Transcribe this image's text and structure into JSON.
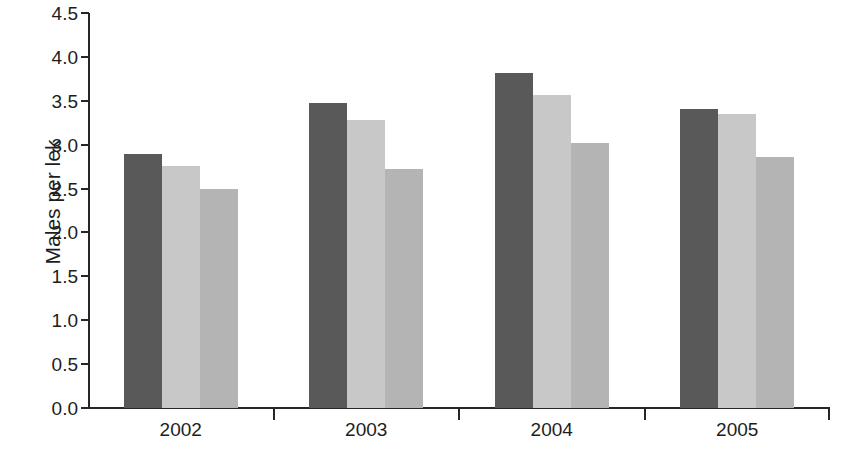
{
  "chart_data": {
    "type": "bar",
    "title": "",
    "subtitle": "",
    "xlabel": "",
    "ylabel": "Males per lek",
    "categories": [
      "2002",
      "2003",
      "2004",
      "2005"
    ],
    "ylim": [
      0.0,
      4.5
    ],
    "ytick_labels": [
      "4.5",
      "4.0",
      "3.5",
      "3.0",
      "2.5",
      "2.0",
      "1.5",
      "1.0",
      "0.5",
      "0.0"
    ],
    "ytick_values": [
      4.5,
      4.0,
      3.5,
      3.0,
      2.5,
      2.0,
      1.5,
      1.0,
      0.5,
      0.0
    ],
    "grid": false,
    "legend": "none",
    "series": [
      {
        "name": "series-1",
        "color": "#595959",
        "values": [
          2.89,
          3.47,
          3.82,
          3.41
        ]
      },
      {
        "name": "series-2",
        "color": "#c8c8c8",
        "values": [
          2.76,
          3.28,
          3.57,
          3.35
        ]
      },
      {
        "name": "series-3",
        "color": "#b4b4b4",
        "values": [
          2.5,
          2.72,
          3.02,
          2.86
        ]
      }
    ],
    "annotations": []
  },
  "figure": {
    "caption_remnant": "",
    "axis_color": "#262626",
    "background": "#ffffff"
  }
}
